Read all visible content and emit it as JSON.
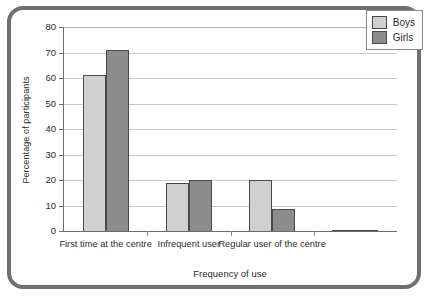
{
  "chart_data": {
    "type": "bar",
    "title": "",
    "xlabel": "Frequency of use",
    "ylabel": "Percentage of participants",
    "categories": [
      "First time at the centre",
      "Infrequent user",
      "Regular user of the centre",
      ""
    ],
    "series": [
      {
        "name": "Boys",
        "color": "#d0d0d0",
        "values": [
          61,
          19,
          20,
          0.3
        ]
      },
      {
        "name": "Girls",
        "color": "#8c8c8c",
        "values": [
          71,
          20,
          8.5,
          0.3
        ]
      }
    ],
    "ylim": [
      0,
      80
    ],
    "yticks": [
      0,
      10,
      20,
      30,
      40,
      50,
      60,
      70,
      80
    ],
    "ytick_labels": [
      "0",
      "10",
      "20",
      "30",
      "40",
      "50",
      "60",
      "70",
      "80"
    ],
    "grid": true,
    "legend_position": "top-right"
  },
  "legend": {
    "entries": [
      {
        "label": "Boys"
      },
      {
        "label": "Girls"
      }
    ]
  },
  "frame": {
    "border_color": "#6f6f6f"
  }
}
